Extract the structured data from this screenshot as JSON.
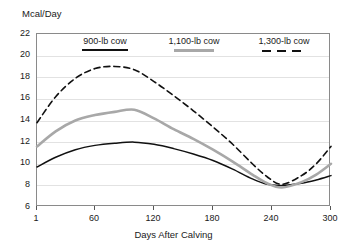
{
  "chart_data": {
    "type": "line",
    "title": "",
    "ylabel": "Mcal/Day",
    "xlabel": "Days After Calving",
    "ylim": [
      6,
      22
    ],
    "xlim": [
      1,
      300
    ],
    "yticks": [
      6,
      8,
      10,
      12,
      14,
      16,
      18,
      20,
      22
    ],
    "xticks": [
      1,
      60,
      120,
      180,
      240,
      300
    ],
    "grid": true,
    "legend_position": "top-inside",
    "series": [
      {
        "name": "900-lb cow",
        "style": "solid",
        "color": "#111111",
        "x": [
          1,
          20,
          40,
          60,
          80,
          100,
          120,
          140,
          160,
          180,
          200,
          220,
          235,
          250,
          270,
          285,
          300
        ],
        "values": [
          9.7,
          10.6,
          11.3,
          11.7,
          11.9,
          12.0,
          11.8,
          11.4,
          10.9,
          10.3,
          9.5,
          8.6,
          8.1,
          8.0,
          8.2,
          8.5,
          8.9
        ]
      },
      {
        "name": "1,100-lb cow",
        "style": "solid",
        "color": "#a8a8a8",
        "x": [
          1,
          20,
          40,
          60,
          80,
          100,
          120,
          140,
          160,
          180,
          200,
          220,
          235,
          250,
          270,
          285,
          300
        ],
        "values": [
          11.6,
          13.0,
          14.0,
          14.5,
          14.8,
          15.0,
          14.2,
          13.2,
          12.3,
          11.3,
          10.2,
          9.0,
          8.2,
          7.8,
          8.3,
          9.0,
          10.0
        ]
      },
      {
        "name": "1,300-lb cow",
        "style": "dashed",
        "color": "#111111",
        "x": [
          1,
          20,
          40,
          60,
          80,
          100,
          120,
          140,
          160,
          180,
          200,
          220,
          235,
          250,
          270,
          285,
          300
        ],
        "values": [
          13.8,
          16.2,
          17.9,
          18.8,
          19.0,
          18.7,
          17.6,
          16.3,
          14.9,
          13.4,
          11.8,
          10.0,
          8.8,
          8.1,
          8.9,
          10.0,
          11.6
        ]
      }
    ]
  },
  "legend": {
    "items": [
      {
        "label": "900-lb cow",
        "swatch": "solid-black"
      },
      {
        "label": "1,100-lb cow",
        "swatch": "solid-gray"
      },
      {
        "label": "1,300-lb cow",
        "swatch": "dashed-black"
      }
    ]
  }
}
